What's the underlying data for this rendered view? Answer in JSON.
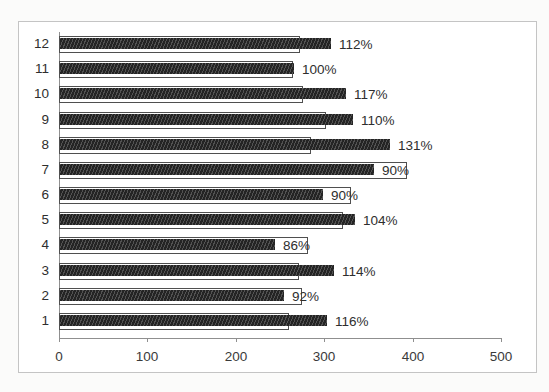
{
  "chart_data": {
    "type": "bar",
    "orientation": "horizontal",
    "title": "",
    "xlabel": "",
    "ylabel": "",
    "xlim": [
      0,
      500
    ],
    "x_ticks": [
      0,
      100,
      200,
      300,
      400,
      500
    ],
    "grid": false,
    "legend": null,
    "bar_style": {
      "filled_bar_color": "#242424",
      "filled_bar_pattern": "dense-diagonal-hatch",
      "outlined_bar_fill": "#ffffff",
      "outlined_bar_border": "#4f4f4f"
    },
    "rows": [
      {
        "category": "12",
        "outlined": 273,
        "filled": 306,
        "percent_label": "112%"
      },
      {
        "category": "11",
        "outlined": 265,
        "filled": 265,
        "percent_label": "100%"
      },
      {
        "category": "10",
        "outlined": 276,
        "filled": 323,
        "percent_label": "117%"
      },
      {
        "category": "9",
        "outlined": 302,
        "filled": 332,
        "percent_label": "110%"
      },
      {
        "category": "8",
        "outlined": 285,
        "filled": 373,
        "percent_label": "131%"
      },
      {
        "category": "7",
        "outlined": 394,
        "filled": 355,
        "percent_label": "90%"
      },
      {
        "category": "6",
        "outlined": 330,
        "filled": 297,
        "percent_label": "90%"
      },
      {
        "category": "5",
        "outlined": 321,
        "filled": 334,
        "percent_label": "104%"
      },
      {
        "category": "4",
        "outlined": 282,
        "filled": 243,
        "percent_label": "86%"
      },
      {
        "category": "3",
        "outlined": 272,
        "filled": 310,
        "percent_label": "114%"
      },
      {
        "category": "2",
        "outlined": 275,
        "filled": 253,
        "percent_label": "92%"
      },
      {
        "category": "1",
        "outlined": 260,
        "filled": 302,
        "percent_label": "116%"
      }
    ]
  }
}
